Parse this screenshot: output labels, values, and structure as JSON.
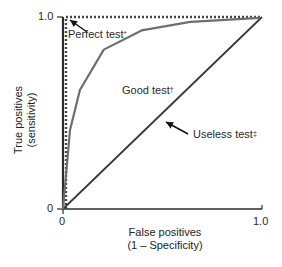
{
  "chart_data": {
    "type": "line",
    "title": "",
    "xlabel": "False positives (1 – Specificity)",
    "ylabel": "True positives (sensitivity)",
    "xlim": [
      0,
      1.0
    ],
    "ylim": [
      0,
      1.0
    ],
    "x_ticks": [
      "0",
      "1.0"
    ],
    "y_ticks": [
      "0",
      "1.0"
    ],
    "grid": false,
    "legend": "none (inline annotations)",
    "series": [
      {
        "name": "Perfect test*",
        "style": "dotted",
        "x": [
          0.0,
          0.0,
          1.0
        ],
        "y": [
          0.0,
          1.0,
          1.0
        ]
      },
      {
        "name": "Good test†",
        "style": "solid gray",
        "x": [
          0.0,
          0.035,
          0.085,
          0.205,
          0.395,
          0.64,
          0.99
        ],
        "y": [
          0.0,
          0.41,
          0.62,
          0.83,
          0.93,
          0.975,
          0.995
        ]
      },
      {
        "name": "Useless test‡",
        "style": "solid dark",
        "x": [
          0.0,
          1.0
        ],
        "y": [
          0.0,
          1.0
        ]
      }
    ],
    "annotations": [
      {
        "text": "Perfect test*",
        "arrow_to": [
          0.0,
          1.0
        ]
      },
      {
        "text": "Good test†",
        "position": [
          0.31,
          0.55
        ]
      },
      {
        "text": "Useless test‡",
        "arrow_to": [
          0.6,
          0.6
        ]
      }
    ]
  },
  "labels": {
    "y_tick_top": "1.0",
    "y_tick_bottom": "0",
    "x_tick_left": "0",
    "x_tick_right": "1.0",
    "ylabel_line1": "True positives",
    "ylabel_line2": "(sensitivity)",
    "xlabel_line1": "False positives",
    "xlabel_line2": "(1 – Specificity)",
    "perfect": "Perfect test",
    "perfect_mark": "*",
    "good": "Good test",
    "good_mark": "†",
    "useless": "Useless test",
    "useless_mark": "‡"
  },
  "colors": {
    "axis": "#2b2b2b",
    "good_curve": "#6e6e6e",
    "useless_line": "#3a3a3a",
    "perfect_dotted": "#444444"
  }
}
